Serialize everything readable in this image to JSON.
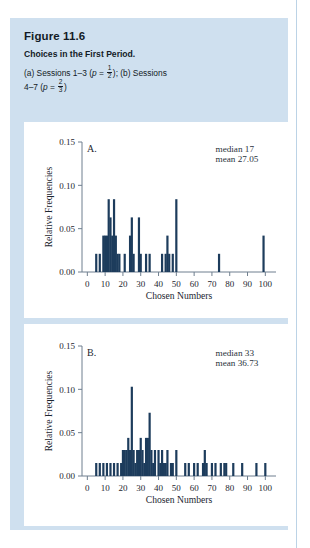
{
  "figure": {
    "number": "Figure 11.6",
    "title": "Choices in the First Period.",
    "subtitle_part1": "(a) Sessions 1–3 (",
    "subtitle_p1": "p",
    "subtitle_eq1": " = ",
    "subtitle_frac1_num": "1",
    "subtitle_frac1_den": "2",
    "subtitle_part2": "); (b) Sessions",
    "subtitle_line2_part1": "4–7 (",
    "subtitle_p2": "p",
    "subtitle_eq2": " = ",
    "subtitle_frac2_num": "2",
    "subtitle_frac2_den": "3",
    "subtitle_line2_part2": ")"
  },
  "colors": {
    "panel_background": "#cfe0ef",
    "plot_background": "#ffffff",
    "bar": "#1d3c5c",
    "axis": "#6f7f8f",
    "text": "#1d2630",
    "page_rule": "#bcd3e6"
  },
  "chart_data": [
    {
      "type": "bar",
      "panel_label": "A.",
      "title": "",
      "xlabel": "Chosen Numbers",
      "ylabel": "Relative Frequencies",
      "xlim": [
        -3,
        106
      ],
      "ylim": [
        0.0,
        0.15
      ],
      "xticks": [
        0,
        10,
        20,
        30,
        40,
        50,
        60,
        70,
        80,
        90,
        100
      ],
      "xticklabels": [
        "0",
        "10",
        "20",
        "30",
        "40",
        "50",
        "60",
        "70",
        "80",
        "90",
        "100"
      ],
      "yticks": [
        0.0,
        0.05,
        0.1,
        0.15
      ],
      "yticklabels": [
        "0.00",
        "0.05",
        "0.10",
        "0.15"
      ],
      "grid": false,
      "legend": "none",
      "annotations": [
        {
          "text": "median 17",
          "x": 72,
          "y": 0.139
        },
        {
          "text": "mean 27.05",
          "x": 72,
          "y": 0.127
        }
      ],
      "stats": {
        "median": 17,
        "mean": 27.05
      },
      "x": [
        5,
        7,
        9,
        10,
        11,
        12,
        13,
        14,
        15,
        16,
        17,
        18,
        21,
        24,
        25,
        26,
        29,
        30,
        33,
        35,
        42,
        44,
        45,
        46,
        48,
        50,
        74,
        99
      ],
      "values": [
        0.021,
        0.021,
        0.042,
        0.042,
        0.042,
        0.084,
        0.063,
        0.042,
        0.084,
        0.042,
        0.021,
        0.021,
        0.021,
        0.042,
        0.063,
        0.021,
        0.063,
        0.021,
        0.021,
        0.021,
        0.021,
        0.021,
        0.042,
        0.021,
        0.021,
        0.084,
        0.021,
        0.042
      ]
    },
    {
      "type": "bar",
      "panel_label": "B.",
      "title": "",
      "xlabel": "Chosen Numbers",
      "ylabel": "Relative Frequencies",
      "xlim": [
        -3,
        106
      ],
      "ylim": [
        0.0,
        0.15
      ],
      "xticks": [
        0,
        10,
        20,
        30,
        40,
        50,
        60,
        70,
        80,
        90,
        100
      ],
      "xticklabels": [
        "0",
        "10",
        "20",
        "30",
        "40",
        "50",
        "60",
        "70",
        "80",
        "90",
        "100"
      ],
      "yticks": [
        0.0,
        0.05,
        0.1,
        0.15
      ],
      "yticklabels": [
        "0.00",
        "0.05",
        "0.10",
        "0.15"
      ],
      "grid": false,
      "legend": "none",
      "annotations": [
        {
          "text": "median 33",
          "x": 72,
          "y": 0.139
        },
        {
          "text": "mean 36.73",
          "x": 72,
          "y": 0.127
        }
      ],
      "stats": {
        "median": 33,
        "mean": 36.73
      },
      "x": [
        5,
        7,
        9,
        11,
        13,
        15,
        17,
        19,
        20,
        21,
        22,
        23,
        24,
        25,
        26,
        27,
        28,
        29,
        30,
        31,
        32,
        33,
        34,
        35,
        36,
        37,
        38,
        40,
        41,
        42,
        43,
        44,
        45,
        47,
        48,
        50,
        55,
        57,
        60,
        62,
        65,
        66,
        67,
        70,
        72,
        75,
        77,
        78,
        82,
        87,
        95,
        100
      ],
      "values": [
        0.015,
        0.015,
        0.015,
        0.015,
        0.015,
        0.015,
        0.015,
        0.015,
        0.03,
        0.03,
        0.03,
        0.044,
        0.03,
        0.103,
        0.03,
        0.015,
        0.03,
        0.03,
        0.044,
        0.03,
        0.015,
        0.044,
        0.044,
        0.073,
        0.03,
        0.015,
        0.03,
        0.03,
        0.015,
        0.03,
        0.015,
        0.015,
        0.03,
        0.015,
        0.015,
        0.03,
        0.015,
        0.015,
        0.015,
        0.015,
        0.015,
        0.03,
        0.015,
        0.015,
        0.015,
        0.015,
        0.015,
        0.015,
        0.015,
        0.015,
        0.015,
        0.015
      ]
    }
  ]
}
